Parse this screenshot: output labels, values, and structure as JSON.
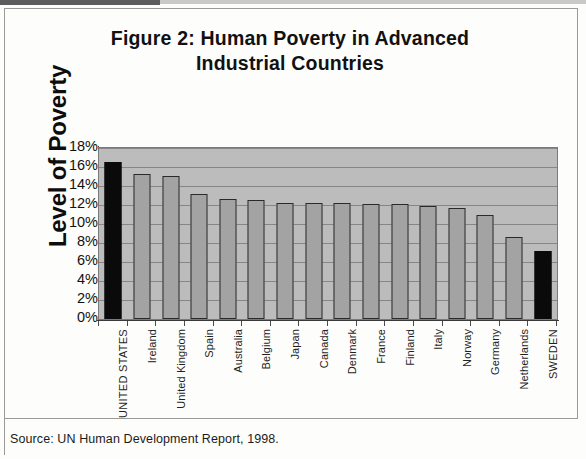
{
  "title": {
    "line1": "Figure 2: Human Poverty in Advanced",
    "line2": "Industrial Countries"
  },
  "source": "Source: UN Human Development Report, 1998.",
  "axis": {
    "ylabel": "Level of Poverty"
  },
  "colors": {
    "plot_background": "#bcbcbc",
    "bar_default": "#a3a3a3",
    "bar_highlight": "#0a0a0a",
    "gridline": "#868686",
    "text": "#111111"
  },
  "chart_data": {
    "type": "bar",
    "title": "Figure 2: Human Poverty in Advanced Industrial Countries",
    "xlabel": "",
    "ylabel": "Level of Poverty",
    "ylim": [
      0,
      18
    ],
    "ytick_labels": [
      "18%",
      "16%",
      "14%",
      "12%",
      "10%",
      "8%",
      "6%",
      "4%",
      "2%",
      "0%"
    ],
    "ytick_values": [
      18,
      16,
      14,
      12,
      10,
      8,
      6,
      4,
      2,
      0
    ],
    "grid": true,
    "legend": "none",
    "value_unit": "%",
    "categories": [
      "UNITED STATES",
      "Ireland",
      "United Kingdom",
      "Spain",
      "Australia",
      "Belgium",
      "Japan",
      "Canada",
      "Denmark",
      "France",
      "Finland",
      "Italy",
      "Norway",
      "Germany",
      "Netherlands",
      "SWEDEN"
    ],
    "values": [
      16.5,
      15.3,
      15.1,
      13.2,
      12.6,
      12.5,
      12.2,
      12.2,
      12.2,
      12.1,
      12.1,
      11.9,
      11.7,
      10.9,
      8.6,
      7.2
    ],
    "highlighted": [
      "UNITED STATES",
      "SWEDEN"
    ]
  }
}
